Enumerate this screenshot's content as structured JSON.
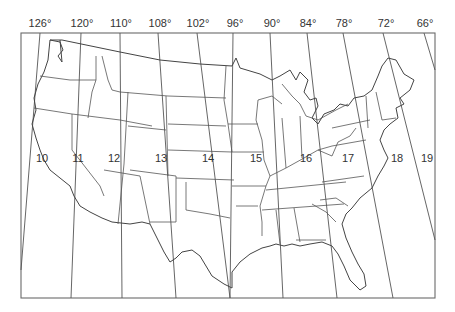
{
  "map": {
    "title": "",
    "frame": {
      "x": 21,
      "y": 33,
      "width": 414,
      "height": 265
    },
    "longitude_labels": [
      {
        "text": "126°",
        "x": 40
      },
      {
        "text": "120°",
        "x": 82
      },
      {
        "text": "110°",
        "x": 121
      },
      {
        "text": "108°",
        "x": 160
      },
      {
        "text": "102°",
        "x": 198
      },
      {
        "text": "96°",
        "x": 235
      },
      {
        "text": "90°",
        "x": 272
      },
      {
        "text": "84°",
        "x": 308
      },
      {
        "text": "78°",
        "x": 344
      },
      {
        "text": "72°",
        "x": 386
      },
      {
        "text": "66°",
        "x": 425
      }
    ],
    "zone_labels": [
      {
        "text": "10",
        "x": 42,
        "y": 162
      },
      {
        "text": "11",
        "x": 78,
        "y": 162
      },
      {
        "text": "12",
        "x": 114,
        "y": 162
      },
      {
        "text": "13",
        "x": 161,
        "y": 162
      },
      {
        "text": "14",
        "x": 208,
        "y": 162
      },
      {
        "text": "15",
        "x": 256,
        "y": 162
      },
      {
        "text": "16",
        "x": 306,
        "y": 162
      },
      {
        "text": "17",
        "x": 348,
        "y": 162
      },
      {
        "text": "18",
        "x": 397,
        "y": 162
      },
      {
        "text": "19",
        "x": 427,
        "y": 162
      }
    ],
    "colors": {
      "line": "#555555",
      "background": "#ffffff",
      "text": "#333333"
    }
  }
}
